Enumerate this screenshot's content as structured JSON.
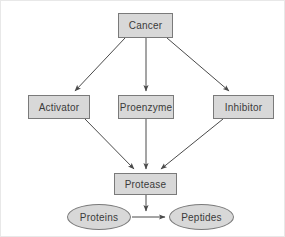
{
  "diagram": {
    "colors": {
      "background": "#ffffff",
      "node_fill": "#d8d8d8",
      "node_border": "#7a7a7a",
      "text": "#3b3b3b",
      "arrow": "#4a4a4a",
      "outer_border": "#e8e8e8"
    },
    "nodes": [
      {
        "id": "cancer",
        "label": "Cancer",
        "shape": "rect",
        "x": 117,
        "y": 12,
        "w": 55,
        "h": 25
      },
      {
        "id": "activator",
        "label": "Activator",
        "shape": "rect",
        "x": 27,
        "y": 94,
        "w": 62,
        "h": 24
      },
      {
        "id": "proenzyme",
        "label": "Proenzyme",
        "shape": "rect",
        "x": 117,
        "y": 94,
        "w": 56,
        "h": 24
      },
      {
        "id": "inhibitor",
        "label": "Inhibitor",
        "shape": "rect",
        "x": 212,
        "y": 94,
        "w": 61,
        "h": 24
      },
      {
        "id": "protease",
        "label": "Protease",
        "shape": "rect",
        "x": 113,
        "y": 172,
        "w": 63,
        "h": 22
      },
      {
        "id": "proteins",
        "label": "Proteins",
        "shape": "ellipse",
        "x": 66,
        "y": 203,
        "w": 64,
        "h": 26
      },
      {
        "id": "peptides",
        "label": "Peptides",
        "shape": "ellipse",
        "x": 168,
        "y": 203,
        "w": 65,
        "h": 26
      }
    ],
    "edges": [
      {
        "id": "cancer-to-activator",
        "from": "cancer",
        "to": "activator",
        "path": "M 124 37 L 74 90",
        "arrow": true
      },
      {
        "id": "cancer-to-proenzyme",
        "from": "cancer",
        "to": "proenzyme",
        "path": "M 145 37 L 145 90",
        "arrow": true
      },
      {
        "id": "cancer-to-inhibitor",
        "from": "cancer",
        "to": "inhibitor",
        "path": "M 166 37 L 228 90",
        "arrow": true
      },
      {
        "id": "activator-to-protease",
        "from": "activator",
        "to": "protease",
        "path": "M 84 118 L 133 168",
        "arrow": true
      },
      {
        "id": "proenzyme-to-protease",
        "from": "proenzyme",
        "to": "protease",
        "path": "M 145 118 L 145 168",
        "arrow": true
      },
      {
        "id": "inhibitor-to-protease",
        "from": "inhibitor",
        "to": "protease",
        "path": "M 222 118 L 160 168",
        "arrow": true
      },
      {
        "id": "protease-to-reaction",
        "from": "protease",
        "to": "reaction",
        "path": "M 145 194 L 145 210",
        "arrow": true
      },
      {
        "id": "proteins-to-peptides",
        "from": "proteins",
        "to": "peptides",
        "path": "M 131 216 L 164 216",
        "arrow": true
      }
    ]
  }
}
